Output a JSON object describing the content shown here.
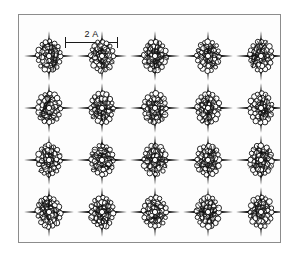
{
  "figure": {
    "kind": "crystal-packing-diagram",
    "background_color": "#ffffff",
    "panel_background_color": "#fdfdfd",
    "border_color": "#8c8c8c",
    "structure_color": "#111111"
  },
  "scale_bar": {
    "label": "2 A",
    "value": 2,
    "unit": "A",
    "length_px": 53,
    "tick_count": 2
  },
  "lattice": {
    "columns": 5,
    "rows": 4,
    "site_count": 20,
    "column_spacing_px": 53,
    "row_spacing_px": 52,
    "first_column_center_px": 30,
    "first_row_center_px": 41,
    "motif_name": "star-cluster-molecule",
    "motif_description": "four-pointed star cluster with N/S/E/W spikes and a ring of atoms",
    "sites": [
      {
        "row": 1,
        "col": 1
      },
      {
        "row": 1,
        "col": 2
      },
      {
        "row": 1,
        "col": 3
      },
      {
        "row": 1,
        "col": 4
      },
      {
        "row": 1,
        "col": 5
      },
      {
        "row": 2,
        "col": 1
      },
      {
        "row": 2,
        "col": 2
      },
      {
        "row": 2,
        "col": 3
      },
      {
        "row": 2,
        "col": 4
      },
      {
        "row": 2,
        "col": 5
      },
      {
        "row": 3,
        "col": 1
      },
      {
        "row": 3,
        "col": 2
      },
      {
        "row": 3,
        "col": 3
      },
      {
        "row": 3,
        "col": 4
      },
      {
        "row": 3,
        "col": 5
      },
      {
        "row": 4,
        "col": 1
      },
      {
        "row": 4,
        "col": 2
      },
      {
        "row": 4,
        "col": 3
      },
      {
        "row": 4,
        "col": 4
      },
      {
        "row": 4,
        "col": 5
      }
    ]
  },
  "chart_data": {
    "type": "scatter",
    "title": "",
    "xlabel": "",
    "ylabel": "",
    "annotations": [
      "2 A"
    ],
    "grid": false,
    "legend": null,
    "series": [
      {
        "name": "star-cluster-molecule",
        "x": [
          30,
          83,
          136,
          189,
          242,
          30,
          83,
          136,
          189,
          242,
          30,
          83,
          136,
          189,
          242,
          30,
          83,
          136,
          189,
          242
        ],
        "y": [
          41,
          41,
          41,
          41,
          41,
          93,
          93,
          93,
          93,
          93,
          145,
          145,
          145,
          145,
          145,
          197,
          197,
          197,
          197,
          197
        ]
      }
    ]
  }
}
